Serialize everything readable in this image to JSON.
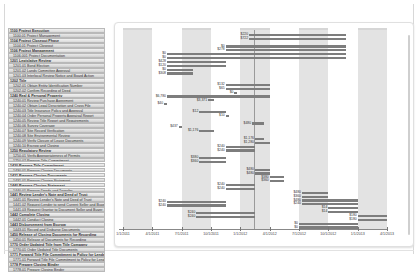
{
  "tasks": [
    {
      "id": "1100",
      "name": "Project Execution",
      "level": 0
    },
    {
      "id": "1100.01",
      "name": "Project Management",
      "level": 1
    },
    {
      "id": "1104",
      "name": "Project Closeout Phase",
      "level": 0
    },
    {
      "id": "1104.01",
      "name": "Project Closeout",
      "level": 1
    },
    {
      "id": "1106",
      "name": "Project Management",
      "level": 0
    },
    {
      "id": "1106.001",
      "name": "Project Documentation",
      "level": 1
    },
    {
      "id": "1201",
      "name": "Legislative Review",
      "level": 0
    },
    {
      "id": "1201.01",
      "name": "Bond Election",
      "level": 1
    },
    {
      "id": "1201.02",
      "name": "Lands Committee Approval",
      "level": 1
    },
    {
      "id": "1201.03",
      "name": "Interlocal Review Notice and Board Action",
      "level": 1
    },
    {
      "id": "1202",
      "name": "Title",
      "level": 0
    },
    {
      "id": "1202.01",
      "name": "Obtain Entity Identification Number",
      "level": 1
    },
    {
      "id": "1202.02",
      "name": "Confirm Recording of Deed",
      "level": 1
    },
    {
      "id": "1240",
      "name": "Real & Personal Property",
      "level": 0
    },
    {
      "id": "1240.01",
      "name": "Review Purchase Agreement",
      "level": 1
    },
    {
      "id": "1240.02",
      "name": "Obtain Legal Description and Cross File",
      "level": 1
    },
    {
      "id": "1240.03",
      "name": "Title Insurance Policy and Approval",
      "level": 1
    },
    {
      "id": "1240.04",
      "name": "Order Personal Property Appraisal Report",
      "level": 1
    },
    {
      "id": "1240.05",
      "name": "Review Title Report and Requirements",
      "level": 1
    },
    {
      "id": "1240.06",
      "name": "Survey Coverage",
      "level": 1
    },
    {
      "id": "1240.07",
      "name": "Site Record Verification",
      "level": 1
    },
    {
      "id": "1240.08",
      "name": "Site Environmental Review",
      "level": 1
    },
    {
      "id": "1240.09",
      "name": "Verify Closure of Lease Documents",
      "level": 1
    },
    {
      "id": "1240.10",
      "name": "Escrow and Closing",
      "level": 1
    },
    {
      "id": "1250",
      "name": "Regulatory Review",
      "level": 0
    },
    {
      "id": "1250.01",
      "name": "Verify Appropriateness of Permits",
      "level": 1
    },
    {
      "id": "1250.02",
      "name": "Prepare Title Commitment",
      "level": 1
    },
    {
      "id": "1430",
      "name": "Prepare Title Commitment",
      "level": 0
    },
    {
      "id": "1430.01",
      "name": "Prepare Closing Documents",
      "level": 1
    },
    {
      "id": "1431",
      "name": "Prepare Closing Documents",
      "level": 0
    },
    {
      "id": "1431.01",
      "name": "Prepare Closing Statement",
      "level": 1
    },
    {
      "id": "1440",
      "name": "Prepare Closing Statement",
      "level": 0
    },
    {
      "id": "1440.01",
      "name": "Prepare Deeds and Transfer",
      "level": 1
    },
    {
      "id": "1441",
      "name": "Review Lender's Note and Deed of Trust",
      "level": 0
    },
    {
      "id": "1441.01",
      "name": "Review Lender's Note and Deed of Trust",
      "level": 1
    },
    {
      "id": "1441.02",
      "name": "Request Lender to send Current Seller and Buyer",
      "level": 1
    },
    {
      "id": "1441.03",
      "name": "Request Grantor to Document Seller and Buyer",
      "level": 1
    },
    {
      "id": "1442",
      "name": "Complete Closing",
      "level": 0
    },
    {
      "id": "1442.01",
      "name": "Conduct Closing",
      "level": 1
    },
    {
      "id": "1443",
      "name": "Disbursement from Escrow",
      "level": 0
    },
    {
      "id": "1443.01",
      "name": "Record and Disburse Documents",
      "level": 1
    },
    {
      "id": "1450",
      "name": "Release of Closing Documents for Recording",
      "level": 0
    },
    {
      "id": "1450.01",
      "name": "Release of Documents for Recording",
      "level": 1
    },
    {
      "id": "1770",
      "name": "Order Updated Title from Title Company",
      "level": 0
    },
    {
      "id": "1770.01",
      "name": "Order Updated Title Documents",
      "level": 1
    },
    {
      "id": "1771",
      "name": "Forward Title File Commitment to Policy for Lender",
      "level": 0
    },
    {
      "id": "1771.01",
      "name": "Forward Title File Commitment to Policy for Lender",
      "level": 1
    },
    {
      "id": "1778",
      "name": "Prepare Closing Binder",
      "level": 0
    },
    {
      "id": "1778.01",
      "name": "Prepare Closing Binder",
      "level": 1
    }
  ],
  "chart_data": {
    "type": "bar",
    "subtype": "gantt",
    "title": "",
    "xlabel": "",
    "ylabel": "",
    "grid": false,
    "legend": null,
    "x_ticks": [
      "1/1/2011",
      "4/1/2011",
      "7/1/2011",
      "10/1/2011",
      "1/1/2012",
      "4/1/2012",
      "7/1/2012",
      "10/1/2012",
      "1/1/2013",
      "4/1/2013"
    ],
    "bands": [
      {
        "from": 0,
        "to": 1
      },
      {
        "from": 2,
        "to": 3
      },
      {
        "from": 4,
        "to": 5
      },
      {
        "from": 6,
        "to": 7
      },
      {
        "from": 8,
        "to": 9
      }
    ],
    "milestone_lines": [
      4.45
    ],
    "bars": [
      {
        "row": 1,
        "start": 4.3,
        "end": 7.6,
        "label": "$220",
        "label2": "$721"
      },
      {
        "row": 2,
        "start": 4.3,
        "end": 7.6,
        "label": "$722"
      },
      {
        "row": 4,
        "start": 3.5,
        "end": 7.6,
        "label": "$0"
      },
      {
        "row": 5,
        "start": 3.5,
        "end": 7.6,
        "label": "$278"
      },
      {
        "row": 6,
        "start": 1.5,
        "end": 7.6,
        "label": "$0"
      },
      {
        "row": 7,
        "start": 1.5,
        "end": 7.6,
        "label": "$0"
      },
      {
        "row": 8,
        "start": 1.5,
        "end": 3.5,
        "label": "$428"
      },
      {
        "row": 9,
        "start": 1.5,
        "end": 3.5,
        "label": "$120"
      },
      {
        "row": 10,
        "start": 1.5,
        "end": 2.4,
        "label": "$0"
      },
      {
        "row": 11,
        "start": 1.5,
        "end": 2.4,
        "label": "$308"
      },
      {
        "row": 14,
        "start": 3.5,
        "end": 5.0,
        "label": "$132"
      },
      {
        "row": 15,
        "start": 3.5,
        "end": 5.0,
        "label": "$65"
      },
      {
        "row": 16,
        "start": 3.8,
        "end": 3.9,
        "label": "$0"
      },
      {
        "row": 17,
        "start": 1.5,
        "end": 5.0,
        "label": "$6,780"
      },
      {
        "row": 18,
        "start": 2.9,
        "end": 3.1,
        "label": "$3,371"
      },
      {
        "row": 19,
        "start": 1.4,
        "end": 1.5,
        "label": "$40"
      },
      {
        "row": 21,
        "start": 2.6,
        "end": 3.5,
        "label": "$12"
      },
      {
        "row": 22,
        "start": 3.5,
        "end": 3.6,
        "label": "$10"
      },
      {
        "row": 24,
        "start": 4.4,
        "end": 4.8,
        "label": "$480"
      },
      {
        "row": 25,
        "start": 1.9,
        "end": 2.0,
        "label": "$437"
      },
      {
        "row": 26,
        "start": 2.6,
        "end": 3.1,
        "label": "$1,176"
      },
      {
        "row": 28,
        "start": 4.5,
        "end": 4.8,
        "label": "$1,176"
      },
      {
        "row": 29,
        "start": 4.5,
        "end": 5.0,
        "label": "$1,280"
      },
      {
        "row": 30,
        "start": 3.5,
        "end": 4.5,
        "label": "$240"
      },
      {
        "row": 31,
        "start": 3.5,
        "end": 4.5,
        "label": "$240"
      },
      {
        "row": 33,
        "start": 2.6,
        "end": 3.5,
        "label": "$380"
      },
      {
        "row": 34,
        "start": 2.6,
        "end": 3.5,
        "label": "$360"
      },
      {
        "row": 36,
        "start": 4.5,
        "end": 5.0,
        "label": "$480"
      },
      {
        "row": 37,
        "start": 4.5,
        "end": 5.0,
        "label": "$480"
      },
      {
        "row": 38,
        "start": 5.0,
        "end": 5.5,
        "label": "$380"
      },
      {
        "row": 39,
        "start": 5.0,
        "end": 5.5,
        "label": "$360"
      },
      {
        "row": 40,
        "start": 3.5,
        "end": 4.5,
        "label": "$240"
      },
      {
        "row": 41,
        "start": 3.5,
        "end": 4.5,
        "label": "$240"
      },
      {
        "row": 42,
        "start": 6.1,
        "end": 7.0,
        "label": "$480"
      },
      {
        "row": 43,
        "start": 6.1,
        "end": 7.0,
        "label": "$360"
      },
      {
        "row": 44,
        "start": 6.1,
        "end": 8.0,
        "label": "$480"
      },
      {
        "row": 45,
        "start": 6.1,
        "end": 8.0,
        "label": "$240"
      },
      {
        "row": 46,
        "start": 7.0,
        "end": 8.0,
        "label": "$14"
      },
      {
        "row": 47,
        "start": 7.0,
        "end": 8.0,
        "label": "$14"
      },
      {
        "row": 48,
        "start": 8.0,
        "end": 9.0,
        "label": "$180"
      },
      {
        "row": 49,
        "start": 8.0,
        "end": 9.0,
        "label": "$180"
      },
      {
        "row": 44.3,
        "start": 1.5,
        "end": 3.5,
        "label": "$240"
      },
      {
        "row": 45.3,
        "start": 1.5,
        "end": 3.5,
        "label": "$240"
      },
      {
        "row": 47.3,
        "start": 2.5,
        "end": 4.5,
        "label": "$240"
      },
      {
        "row": 48.3,
        "start": 2.5,
        "end": 4.5,
        "label": "$240"
      },
      {
        "row": 50,
        "start": 6.0,
        "end": 8.0,
        "label": "$0"
      },
      {
        "row": 51,
        "start": 6.0,
        "end": 8.0,
        "label": "$0"
      }
    ]
  }
}
